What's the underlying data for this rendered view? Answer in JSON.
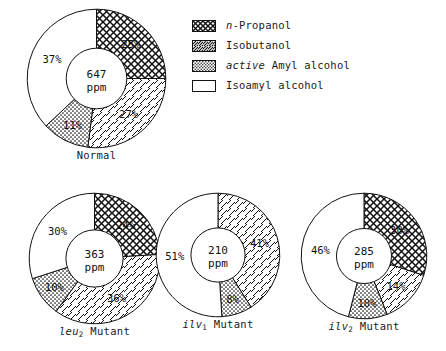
{
  "legend": {
    "items": [
      {
        "pattern": "cross-hatch",
        "label_italic": "n",
        "label_rest": "-Propanol",
        "key": "n_propanol"
      },
      {
        "pattern": "diagonal",
        "label_italic": "",
        "label_rest": "Isobutanol",
        "key": "isobutanol"
      },
      {
        "pattern": "dotted",
        "label_italic": "active",
        "label_rest": " Amyl alcohol",
        "key": "active_amyl_alcohol"
      },
      {
        "pattern": "blank",
        "label_italic": "",
        "label_rest": "Isoamyl alcohol",
        "key": "isoamyl_alcohol"
      }
    ]
  },
  "chart_data": [
    {
      "type": "pie",
      "title": "Normal",
      "title_italic": "",
      "title_sub": "",
      "title_rest": "Normal",
      "center_value": "647",
      "center_unit": "ppm",
      "categories": [
        "n-Propanol",
        "Isobutanol",
        "active Amyl alcohol",
        "Isoamyl alcohol"
      ],
      "patterns": [
        "cross-hatch",
        "diagonal",
        "dotted",
        "blank"
      ],
      "values": [
        25,
        27,
        11,
        37
      ],
      "labels": [
        "25%",
        "27%",
        "11%",
        "37%"
      ]
    },
    {
      "type": "pie",
      "title": "leu2 Mutant",
      "title_italic": "leu",
      "title_sub": "2",
      "title_rest": " Mutant",
      "center_value": "363",
      "center_unit": "ppm",
      "categories": [
        "n-Propanol",
        "Isobutanol",
        "active Amyl alcohol",
        "Isoamyl alcohol"
      ],
      "patterns": [
        "cross-hatch",
        "diagonal",
        "dotted",
        "blank"
      ],
      "values": [
        24,
        36,
        10,
        30
      ],
      "labels": [
        "24%",
        "36%",
        "10%",
        "30%"
      ]
    },
    {
      "type": "pie",
      "title": "ilv1 Mutant",
      "title_italic": "ilv",
      "title_sub": "1",
      "title_rest": " Mutant",
      "center_value": "210",
      "center_unit": "ppm",
      "categories": [
        "Isobutanol",
        "active Amyl alcohol",
        "Isoamyl alcohol"
      ],
      "patterns": [
        "diagonal",
        "dotted",
        "blank"
      ],
      "values": [
        41,
        8,
        51
      ],
      "labels": [
        "41%",
        "8%",
        "51%"
      ]
    },
    {
      "type": "pie",
      "title": "ilv2 Mutant",
      "title_italic": "ilv",
      "title_sub": "2",
      "title_rest": " Mutant",
      "center_value": "285",
      "center_unit": "ppm",
      "categories": [
        "n-Propanol",
        "Isobutanol",
        "active Amyl alcohol",
        "Isoamyl alcohol"
      ],
      "patterns": [
        "cross-hatch",
        "diagonal",
        "dotted",
        "blank"
      ],
      "values": [
        30,
        14,
        10,
        46
      ],
      "labels": [
        "30%",
        "14%",
        "10%",
        "46%"
      ]
    }
  ],
  "colors": {
    "stroke": "#111111",
    "background": "#ffffff"
  }
}
